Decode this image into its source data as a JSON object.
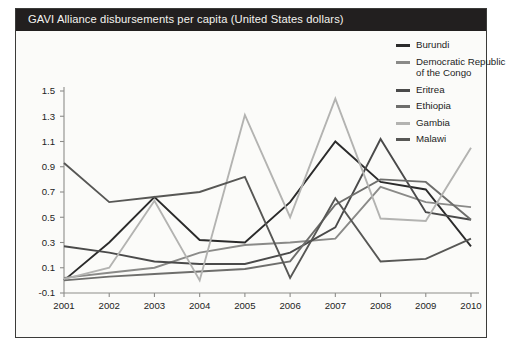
{
  "title": "GAVI Alliance disbursements per capita (United States dollars)",
  "colors": {
    "title_bar": "#221f1f",
    "title_text": "#f4f3ef",
    "frame": "#3b3b39",
    "axis": "#8d8d8a",
    "background": "#fbfbf9"
  },
  "chart_data": {
    "type": "line",
    "title": "GAVI Alliance disbursements per capita (United States dollars)",
    "xlabel": "",
    "ylabel": "",
    "grid": false,
    "legend_position": "right",
    "categories": [
      "2001",
      "2002",
      "2003",
      "2004",
      "2005",
      "2006",
      "2007",
      "2008",
      "2009",
      "2010"
    ],
    "x": [
      2001,
      2002,
      2003,
      2004,
      2005,
      2006,
      2007,
      2008,
      2009,
      2010
    ],
    "xlim": [
      2001,
      2010
    ],
    "ylim": [
      -0.1,
      1.5
    ],
    "yticks": [
      "-0.1",
      "0.1",
      "0.3",
      "0.5",
      "0.7",
      "0.9",
      "1.1",
      "1.3",
      "1.5"
    ],
    "ytick_values": [
      -0.1,
      0.1,
      0.3,
      0.5,
      0.7,
      0.9,
      1.1,
      1.3,
      1.5
    ],
    "series": [
      {
        "name": "Burundi",
        "color": "#2b2b2b",
        "values": [
          0.0,
          0.3,
          0.66,
          0.32,
          0.3,
          0.62,
          1.1,
          0.78,
          0.72,
          0.27
        ]
      },
      {
        "name": "Democratic Republic of the Congo",
        "color": "#8a8a88",
        "values": [
          0.02,
          0.06,
          0.1,
          0.22,
          0.28,
          0.3,
          0.33,
          0.74,
          0.62,
          0.58
        ]
      },
      {
        "name": "Eritrea",
        "color": "#4a4a4a",
        "values": [
          0.27,
          0.22,
          0.15,
          0.13,
          0.13,
          0.22,
          0.42,
          1.12,
          0.54,
          0.48
        ]
      },
      {
        "name": "Ethiopia",
        "color": "#6e6e6c",
        "values": [
          0.0,
          0.03,
          0.05,
          0.07,
          0.09,
          0.15,
          0.6,
          0.8,
          0.78,
          0.48
        ]
      },
      {
        "name": "Gambia",
        "color": "#b3b3b1",
        "values": [
          0.01,
          0.1,
          0.63,
          0.0,
          1.31,
          0.5,
          1.44,
          0.49,
          0.47,
          1.05
        ]
      },
      {
        "name": "Malawi",
        "color": "#575755",
        "values": [
          0.93,
          0.62,
          0.66,
          0.7,
          0.82,
          0.02,
          0.65,
          0.15,
          0.17,
          0.33
        ]
      }
    ]
  },
  "legend": {
    "items": [
      {
        "label": "Burundi",
        "color": "#2b2b2b"
      },
      {
        "label": "Democratic Republic of the Congo",
        "color": "#8a8a88"
      },
      {
        "label": "Eritrea",
        "color": "#4a4a4a"
      },
      {
        "label": "Ethiopia",
        "color": "#6e6e6c"
      },
      {
        "label": "Gambia",
        "color": "#b3b3b1"
      },
      {
        "label": "Malawi",
        "color": "#575755"
      }
    ]
  }
}
